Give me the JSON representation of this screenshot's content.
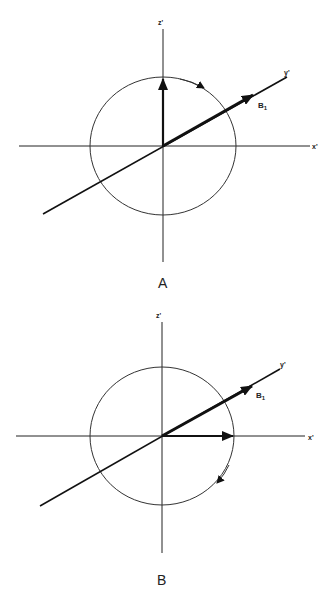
{
  "panels": [
    {
      "id": "A",
      "caption": "A",
      "axes": {
        "x": "x'",
        "y": "y'",
        "z": "z'"
      },
      "field_label": "B",
      "field_subscript": "1",
      "magnetization_direction": "+z'",
      "rotation_sense": "clockwise (viewed toward +y')"
    },
    {
      "id": "B",
      "caption": "B",
      "axes": {
        "x": "x'",
        "y": "y'",
        "z": "z'"
      },
      "field_label": "B",
      "field_subscript": "1",
      "magnetization_direction": "+x'",
      "rotation_sense": "clockwise (viewed toward +y')"
    }
  ]
}
